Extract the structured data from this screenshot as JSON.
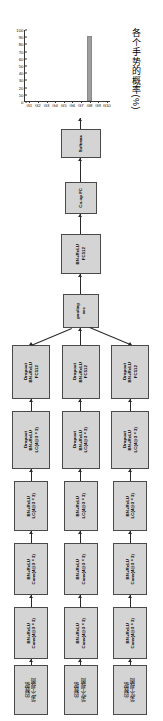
{
  "chart_data": {
    "type": "bar",
    "title": "",
    "xlabel": "",
    "ylabel": "各个手势的概率(%)",
    "categories": [
      "G1",
      "G2",
      "G3",
      "G4",
      "G5",
      "G6",
      "G7",
      "G8",
      "G9",
      "G10"
    ],
    "values": [
      0,
      0,
      0,
      0,
      0,
      0,
      0,
      90,
      0,
      0
    ],
    "yticks": [
      "100",
      "90",
      "80",
      "70",
      "60",
      "50",
      "40",
      "30",
      "20",
      "10",
      "0"
    ],
    "ylim": [
      0,
      100
    ],
    "grid": false,
    "legend": null,
    "bar_color": "#9e9e9e"
  },
  "diagram": {
    "softmax": {
      "label": "Softmax"
    },
    "coop_fc": {
      "label": "Co-op FC"
    },
    "fc512_top": {
      "line1": "FC512",
      "line2": "BN+ReLU"
    },
    "vec_pooling": {
      "line1": "vec",
      "line2": "pooling"
    },
    "branches": [
      {
        "id": "view-1",
        "fc512": {
          "line1": "FC512",
          "line2": "BN+ReLU",
          "line3": "Dropout"
        },
        "lc_dropout": {
          "line1": "LC(4@3×3)",
          "line2": "BN+ReLU",
          "line3": "Dropout"
        },
        "lc": {
          "line1": "LC(4@3×3)",
          "line2": "BN+ReLU"
        },
        "conv_upper": {
          "line1": "Conv(4@3×3)",
          "line2": "BN+ReLU"
        },
        "conv_lower": {
          "line1": "Conv(4@3×3)",
          "line2": "BN+ReLU"
        },
        "input": {
          "line1": "第1个视图",
          "line2": "的数据"
        }
      },
      {
        "id": "view-2",
        "fc512": {
          "line1": "FC512",
          "line2": "BN+ReLU",
          "line3": "Dropout"
        },
        "lc_dropout": {
          "line1": "LC(4@3×3)",
          "line2": "BN+ReLU",
          "line3": "Dropout"
        },
        "lc": {
          "line1": "LC(4@3×3)",
          "line2": "BN+ReLU"
        },
        "conv_upper": {
          "line1": "Conv(4@3×3)",
          "line2": "BN+ReLU"
        },
        "conv_lower": {
          "line1": "Conv(4@3×3)",
          "line2": "BN+ReLU"
        },
        "input": {
          "line1": "第2个视图",
          "line2": "的数据"
        }
      },
      {
        "id": "view-3",
        "fc512": {
          "line1": "FC512",
          "line2": "BN+ReLU",
          "line3": "Dropout"
        },
        "lc_dropout": {
          "line1": "LC(4@3×3)",
          "line2": "BN+ReLU",
          "line3": "Dropout"
        },
        "lc": {
          "line1": "LC(4@3×3)",
          "line2": "BN+ReLU"
        },
        "conv_upper": {
          "line1": "Conv(4@3×3)",
          "line2": "BN+ReLU"
        },
        "conv_lower": {
          "line1": "Conv(4@3×3)",
          "line2": "BN+ReLU"
        },
        "input": {
          "line1": "第3个视图",
          "line2": "的数据"
        }
      }
    ]
  }
}
